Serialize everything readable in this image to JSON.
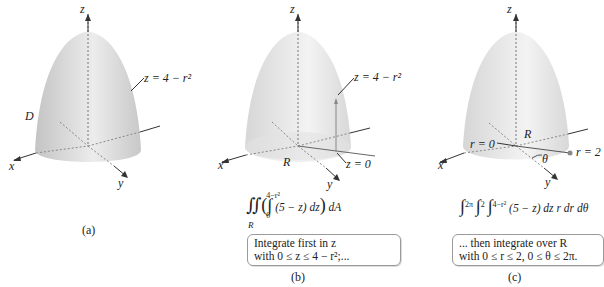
{
  "panels": [
    {
      "id": "a",
      "caption": "(a)",
      "labels": {
        "axis_z": "z",
        "axis_x": "x",
        "axis_y": "y",
        "surface": "z = 4 − r²",
        "region": "D"
      }
    },
    {
      "id": "b",
      "caption": "(b)",
      "labels": {
        "axis_z": "z",
        "axis_x": "x",
        "axis_y": "y",
        "surface": "z = 4 − r²",
        "base": "z = 0",
        "region": "R"
      },
      "formula": "∬_R ( ∫_0^{4−r²} (5 − z) dz ) dA",
      "formula_parts": {
        "upper": "4−r²",
        "lower": "0",
        "region_sub": "R",
        "integrand": "(5 − z) dz",
        "outer": "dA"
      },
      "note": [
        "Integrate first in z",
        "with 0 ≤ z ≤ 4 − r²;..."
      ]
    },
    {
      "id": "c",
      "caption": "(c)",
      "labels": {
        "axis_z": "z",
        "axis_x": "x",
        "axis_y": "y",
        "r0": "r = 0",
        "r2": "r = 2",
        "region": "R",
        "angle": "θ"
      },
      "formula": "∫_0^{2π} ∫_0^2 ∫_0^{4−r²} (5 − z) dz r dr dθ",
      "formula_parts": {
        "u1": "2π",
        "u2": "2",
        "u3": "4−r²",
        "l": "0",
        "integrand": "(5 − z) dz r dr dθ"
      },
      "note": [
        "... then integrate over R",
        "with 0 ≤ r ≤ 2, 0 ≤ θ ≤ 2π."
      ]
    }
  ],
  "colors": {
    "surface_light": "#f2f2f2",
    "surface_dark": "#bdbdbd",
    "axis": "#333333",
    "dashed": "#8a8a8a",
    "point": "#888888"
  }
}
